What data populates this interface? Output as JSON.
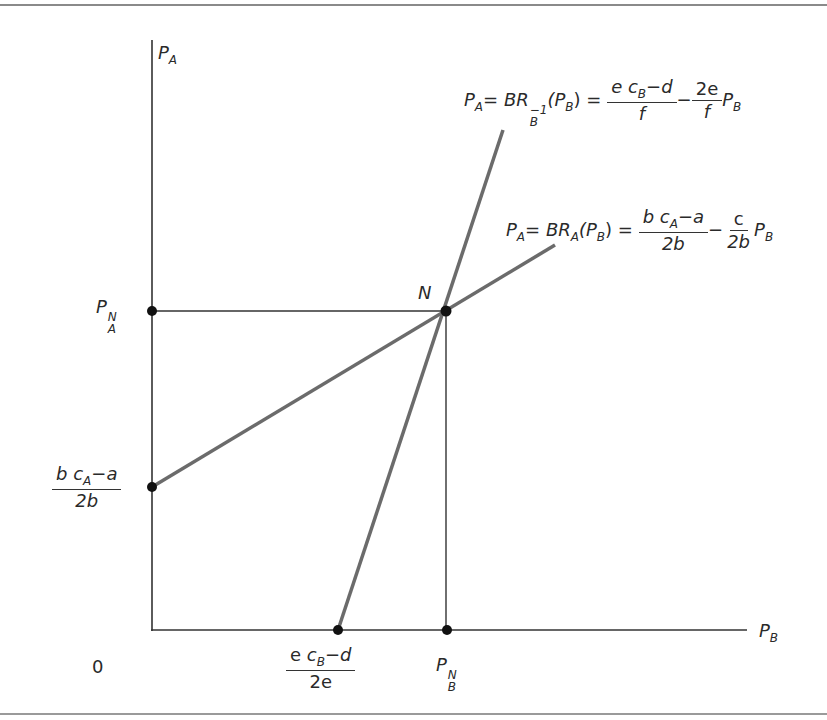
{
  "diagram": {
    "type": "best-response-equilibrium",
    "axes": {
      "y_label": {
        "base": "P",
        "sub": "A"
      },
      "x_label": {
        "base": "P",
        "sub": "B"
      },
      "origin": "0"
    },
    "equilibrium": {
      "label": "N"
    },
    "y_marks": {
      "pan": {
        "base": "P",
        "sup": "N",
        "sub": "A"
      },
      "intercept": {
        "num_b": "b",
        "num_c": "c",
        "num_sub": "A",
        "num_rest": "−a",
        "den": "2b"
      }
    },
    "x_marks": {
      "intercept": {
        "num_e": "e",
        "num_c": "c",
        "num_sub": "B",
        "num_rest": "−d",
        "den": "2e"
      },
      "pbn": {
        "base": "P",
        "sup": "N",
        "sub": "B"
      }
    },
    "curves": {
      "br_b_inverse": {
        "lhs": "P",
        "lhs_sub": "A",
        "eq": "= ",
        "fn": "BR",
        "fn_sup": "−1",
        "fn_sub": "B",
        "arg": "(P",
        "arg_sub": "B",
        "arg_close": ") =",
        "frac1_num": "e c",
        "frac1_num_sub": "B",
        "frac1_num_rest": "−d",
        "frac1_den": "f",
        "minus": "−",
        "frac2_num": "2e",
        "frac2_den": "f",
        "tail": "P",
        "tail_sub": "B"
      },
      "br_a": {
        "lhs": "P",
        "lhs_sub": "A",
        "eq": "= ",
        "fn": "BR",
        "fn_sub": "A",
        "arg": "(P",
        "arg_sub": "B",
        "arg_close": ") =",
        "frac1_num": "b c",
        "frac1_num_sub": "A",
        "frac1_num_rest": "−a",
        "frac1_den": "2b",
        "minus": "−",
        "frac2_num": "c",
        "frac2_den": "2b",
        "tail": "P",
        "tail_sub": "B"
      }
    },
    "colors": {
      "axis": "#333333",
      "curve": "#6b6b6b",
      "dot": "#111111",
      "frame": "#8a8a8a"
    }
  }
}
